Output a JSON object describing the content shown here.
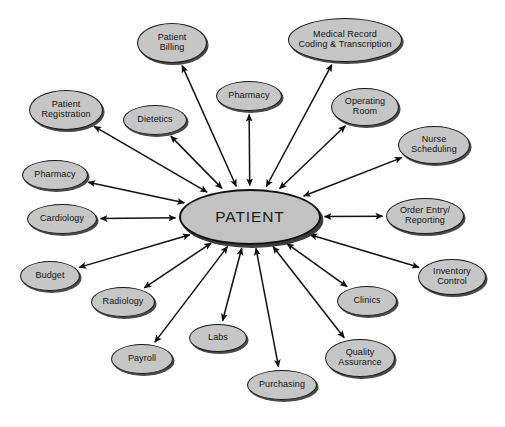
{
  "diagram": {
    "type": "hub-and-spoke",
    "title": "PATIENT",
    "background_color": "#ffffff",
    "node_fill_color": "#c6c6c6",
    "node_border_color": "#1a1a1a",
    "edge_color": "#111111",
    "hub": {
      "label": "PATIENT",
      "cx": 250,
      "cy": 217,
      "rx": 71,
      "ry": 28
    },
    "nodes": [
      {
        "id": "patient-billing",
        "label": "Patient\nBilling",
        "cx": 172,
        "cy": 43,
        "rx": 35,
        "ry": 20,
        "size": "medium"
      },
      {
        "id": "medical-record",
        "label": "Medical Record\nCoding & Transcription",
        "cx": 345,
        "cy": 40,
        "rx": 57,
        "ry": 22,
        "size": "medium"
      },
      {
        "id": "pharmacy-top",
        "label": "Pharmacy",
        "cx": 249,
        "cy": 96,
        "rx": 33,
        "ry": 15,
        "size": "medium"
      },
      {
        "id": "operating-room",
        "label": "Operating\nRoom",
        "cx": 365,
        "cy": 107,
        "rx": 34,
        "ry": 19,
        "size": "medium"
      },
      {
        "id": "patient-reg",
        "label": "Patient\nRegistration",
        "cx": 66,
        "cy": 110,
        "rx": 37,
        "ry": 20,
        "size": "medium"
      },
      {
        "id": "dietetics",
        "label": "Dietetics",
        "cx": 155,
        "cy": 120,
        "rx": 32,
        "ry": 15,
        "size": "medium"
      },
      {
        "id": "nurse-scheduling",
        "label": "Nurse\nScheduling",
        "cx": 434,
        "cy": 145,
        "rx": 36,
        "ry": 19,
        "size": "medium"
      },
      {
        "id": "pharmacy-left",
        "label": "Pharmacy",
        "cx": 55,
        "cy": 175,
        "rx": 33,
        "ry": 15,
        "size": "medium"
      },
      {
        "id": "cardiology",
        "label": "Cardiology",
        "cx": 62,
        "cy": 219,
        "rx": 35,
        "ry": 15,
        "size": "medium"
      },
      {
        "id": "order-entry",
        "label": "Order Entry/\nReporting",
        "cx": 425,
        "cy": 216,
        "rx": 39,
        "ry": 18,
        "size": "medium"
      },
      {
        "id": "budget",
        "label": "Budget",
        "cx": 50,
        "cy": 276,
        "rx": 30,
        "ry": 15,
        "size": "medium"
      },
      {
        "id": "inventory",
        "label": "Inventory\nControl",
        "cx": 452,
        "cy": 277,
        "rx": 34,
        "ry": 18,
        "size": "medium"
      },
      {
        "id": "radiology",
        "label": "Radiology",
        "cx": 123,
        "cy": 302,
        "rx": 32,
        "ry": 15,
        "size": "medium"
      },
      {
        "id": "clinics",
        "label": "Clinics",
        "cx": 367,
        "cy": 301,
        "rx": 30,
        "ry": 15,
        "size": "medium"
      },
      {
        "id": "labs",
        "label": "Labs",
        "cx": 218,
        "cy": 338,
        "rx": 29,
        "ry": 14,
        "size": "medium"
      },
      {
        "id": "quality",
        "label": "Quality\nAssurance",
        "cx": 360,
        "cy": 358,
        "rx": 35,
        "ry": 19,
        "size": "medium"
      },
      {
        "id": "payroll",
        "label": "Payroll",
        "cx": 142,
        "cy": 359,
        "rx": 31,
        "ry": 15,
        "size": "medium"
      },
      {
        "id": "purchasing",
        "label": "Purchasing",
        "cx": 282,
        "cy": 385,
        "rx": 35,
        "ry": 15,
        "size": "medium"
      }
    ],
    "edges": [
      {
        "from": "hub",
        "to": "patient-billing",
        "arrow": "both"
      },
      {
        "from": "hub",
        "to": "medical-record",
        "arrow": "both"
      },
      {
        "from": "hub",
        "to": "pharmacy-top",
        "arrow": "both"
      },
      {
        "from": "hub",
        "to": "operating-room",
        "arrow": "both"
      },
      {
        "from": "hub",
        "to": "patient-reg",
        "arrow": "both"
      },
      {
        "from": "hub",
        "to": "dietetics",
        "arrow": "both"
      },
      {
        "from": "hub",
        "to": "nurse-scheduling",
        "arrow": "both"
      },
      {
        "from": "hub",
        "to": "pharmacy-left",
        "arrow": "both"
      },
      {
        "from": "hub",
        "to": "cardiology",
        "arrow": "both"
      },
      {
        "from": "hub",
        "to": "order-entry",
        "arrow": "both"
      },
      {
        "from": "hub",
        "to": "budget",
        "arrow": "both"
      },
      {
        "from": "hub",
        "to": "inventory",
        "arrow": "both"
      },
      {
        "from": "hub",
        "to": "radiology",
        "arrow": "both"
      },
      {
        "from": "hub",
        "to": "clinics",
        "arrow": "both"
      },
      {
        "from": "hub",
        "to": "labs",
        "arrow": "both"
      },
      {
        "from": "hub",
        "to": "quality",
        "arrow": "both"
      },
      {
        "from": "hub",
        "to": "payroll",
        "arrow": "both"
      },
      {
        "from": "hub",
        "to": "purchasing",
        "arrow": "both"
      }
    ]
  }
}
